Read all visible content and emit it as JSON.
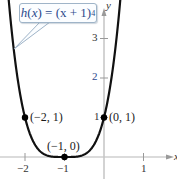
{
  "chart_data": {
    "type": "line",
    "title": "",
    "function_label": "h(x) = (x + 1)^4",
    "function_parts": {
      "name": "h",
      "var": "x",
      "body": "(x + 1)",
      "exponent": "4"
    },
    "xlabel": "x",
    "ylabel": "y",
    "xlim": [
      -2.5,
      1.7
    ],
    "ylim": [
      -0.5,
      4
    ],
    "x_ticks": [
      -2,
      -1,
      1
    ],
    "x_tick_labels": [
      "−2",
      "−1",
      "1"
    ],
    "y_ticks": [
      1,
      2,
      3
    ],
    "y_tick_labels": [
      "1",
      "2",
      "3"
    ],
    "grid": false,
    "series": [
      {
        "name": "h(x) = (x + 1)^4",
        "color": "#111111",
        "function": "(x+1)^4",
        "domain": [
          -2.42,
          0.42
        ]
      }
    ],
    "points": [
      {
        "x": -2,
        "y": 1,
        "label": "(−2, 1)"
      },
      {
        "x": -1,
        "y": 0,
        "label": "(−1, 0)"
      },
      {
        "x": 0,
        "y": 1,
        "label": "(0, 1)"
      }
    ],
    "colors": {
      "curve": "#111111",
      "axis": "#b8b8b8",
      "callout_border": "#9fb4c8",
      "callout_text": "#2c4a8c"
    }
  },
  "layout": {
    "origin_px": [
      104,
      157
    ],
    "unit_x_px": 39.5,
    "unit_y_px": 39.5
  }
}
